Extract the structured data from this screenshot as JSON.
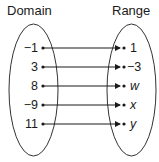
{
  "diagram": {
    "type": "mapping",
    "domain_title": "Domain",
    "range_title": "Range",
    "domain": [
      "−1",
      "3",
      "8",
      "−9",
      "11"
    ],
    "range": [
      {
        "label": "1",
        "italic": false
      },
      {
        "label": "−3",
        "italic": false
      },
      {
        "label": "w",
        "italic": true
      },
      {
        "label": "x",
        "italic": true
      },
      {
        "label": "y",
        "italic": true
      }
    ],
    "mappings": [
      {
        "from": "−1",
        "to": "1"
      },
      {
        "from": "3",
        "to": "−3"
      },
      {
        "from": "8",
        "to": "w"
      },
      {
        "from": "−9",
        "to": "x"
      },
      {
        "from": "11",
        "to": "y"
      }
    ]
  }
}
